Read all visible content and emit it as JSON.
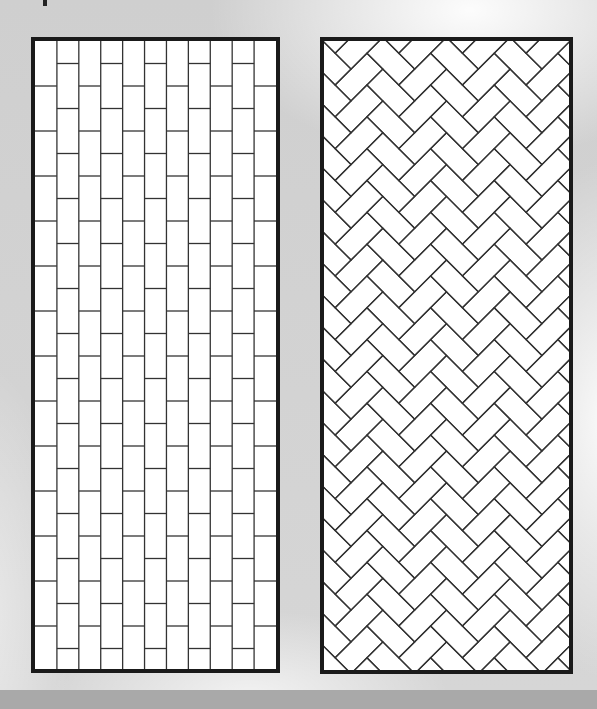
{
  "figure": {
    "background_color": "#d3d3d3",
    "band_color": "#a9a9a9",
    "border_color": "#1a1a1a",
    "joint_color": "#333333",
    "tile_fill": "#ffffff"
  },
  "panels": [
    {
      "name": "stacked-bond-vertical",
      "pattern": "offset-brick-vertical",
      "x": 31,
      "y": 37,
      "width": 249,
      "height": 636,
      "border_width": 4,
      "columns": 11,
      "brick_width": 22,
      "brick_height": 45,
      "offset": 22.5
    },
    {
      "name": "herringbone-45",
      "pattern": "herringbone-diagonal",
      "x": 320,
      "y": 37,
      "width": 253,
      "height": 637,
      "border_width": 4,
      "brick_short": 22.5,
      "brick_long": 45,
      "rotation_deg": 45
    }
  ]
}
